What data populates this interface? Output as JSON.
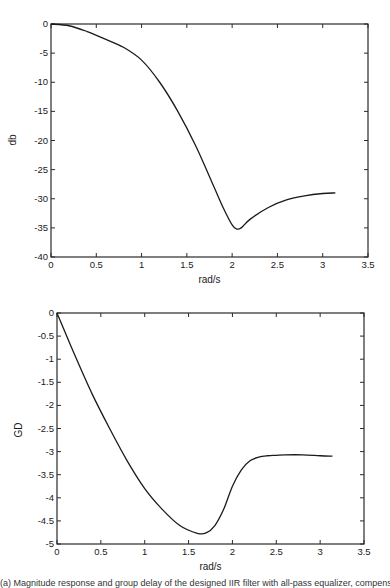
{
  "chart_data": [
    {
      "type": "line",
      "title": "",
      "xlabel": "rad/s",
      "ylabel": "db",
      "xlim": [
        0,
        3.5
      ],
      "ylim": [
        -40,
        0
      ],
      "grid": false,
      "xticks": [
        "0",
        "0.5",
        "1",
        "1.5",
        "2",
        "2.5",
        "3",
        "3.5"
      ],
      "yticks": [
        "0",
        "-5",
        "-10",
        "-15",
        "-20",
        "-25",
        "-30",
        "-35",
        "-40"
      ],
      "series": [
        {
          "name": "magnitude",
          "x": [
            0,
            0.2,
            0.4,
            0.6,
            0.8,
            1.0,
            1.2,
            1.4,
            1.6,
            1.8,
            1.9,
            2.0,
            2.05,
            2.1,
            2.2,
            2.4,
            2.6,
            2.8,
            3.0,
            3.14
          ],
          "y": [
            0,
            -0.3,
            -1.3,
            -2.6,
            -4.0,
            -6.2,
            -10.0,
            -15.0,
            -21.0,
            -28.0,
            -31.5,
            -34.5,
            -35.2,
            -35.0,
            -33.5,
            -31.5,
            -30.2,
            -29.5,
            -29.1,
            -29.0
          ]
        }
      ]
    },
    {
      "type": "line",
      "title": "",
      "xlabel": "rad/s",
      "ylabel": "GD",
      "xlim": [
        0,
        3.5
      ],
      "ylim": [
        -5,
        0
      ],
      "grid": false,
      "xticks": [
        "0",
        "0.5",
        "1",
        "1.5",
        "2",
        "2.5",
        "3",
        "3.5"
      ],
      "yticks": [
        "0",
        "-0.5",
        "-1",
        "-1.5",
        "-2",
        "-2.5",
        "-3",
        "-3.5",
        "-4",
        "-4.5",
        "-5"
      ],
      "series": [
        {
          "name": "group delay",
          "x": [
            0,
            0.2,
            0.4,
            0.6,
            0.8,
            1.0,
            1.2,
            1.4,
            1.6,
            1.7,
            1.8,
            1.9,
            2.0,
            2.1,
            2.2,
            2.3,
            2.4,
            2.5,
            2.6,
            2.8,
            3.0,
            3.14
          ],
          "y": [
            0,
            -0.9,
            -1.75,
            -2.5,
            -3.2,
            -3.8,
            -4.25,
            -4.6,
            -4.77,
            -4.76,
            -4.6,
            -4.25,
            -3.75,
            -3.4,
            -3.2,
            -3.12,
            -3.09,
            -3.08,
            -3.07,
            -3.07,
            -3.09,
            -3.1
          ]
        }
      ]
    }
  ],
  "caption": "(a) Magnitude response and group delay of the designed IIR filter with all-pass equalizer, compensating for the phase"
}
